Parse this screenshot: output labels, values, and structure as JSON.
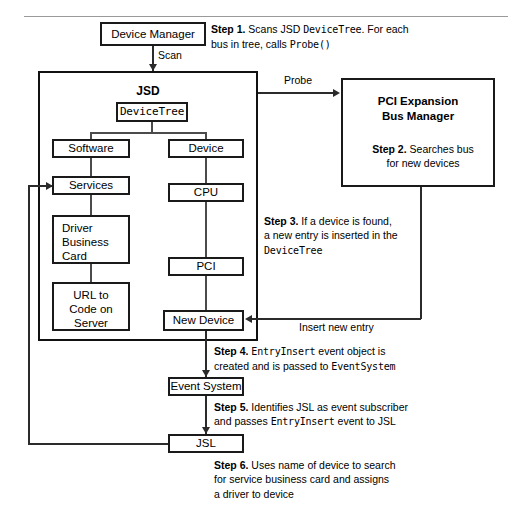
{
  "diagram": {
    "colors": {
      "box_border": "#1a1a1a",
      "container_border": "#111111",
      "line": "#4b4b4b",
      "arrow": "#2b2b2b",
      "rule": "#9a9a9a",
      "background": "#ffffff"
    }
  },
  "nodes": {
    "device_manager": "Device Manager",
    "jsd_title": "JSD",
    "device_tree": "DeviceTree",
    "software": "Software",
    "services": "Services",
    "driver_business_card": "Driver\nBusiness\nCard",
    "driver_business_card_lines": [
      "Driver",
      "Business",
      "Card"
    ],
    "url_to_code": "URL to\nCode on\nServer",
    "url_to_code_lines": [
      "URL to",
      "Code on",
      "Server"
    ],
    "device": "Device",
    "cpu": "CPU",
    "pci": "PCI",
    "new_device": "New Device",
    "event_system": "Event System",
    "jsl": "JSL",
    "pci_expansion_line1": "PCI Expansion",
    "pci_expansion_line2": "Bus Manager"
  },
  "edges": {
    "scan": "Scan",
    "probe": "Probe",
    "insert_new_entry": "Insert new entry"
  },
  "steps": {
    "step1": {
      "label": "Step 1.",
      "line1_a": "Scans JSD ",
      "line1_code": "DeviceTree",
      "line1_b": ". For each",
      "line2_a": "bus in tree, calls ",
      "line2_code": "Probe()"
    },
    "step2": {
      "label": "Step 2.",
      "line1": "Searches bus",
      "line2": "for new devices"
    },
    "step3": {
      "label": "Step 3.",
      "line1": "If a device is found,",
      "line2": "a new entry is inserted in the",
      "line3_code": "DeviceTree"
    },
    "step4": {
      "label": "Step 4.",
      "line1_code": "EntryInsert",
      "line1_a": " event object is",
      "line2_a": "created and is passed to ",
      "line2_code": "EventSystem"
    },
    "step5": {
      "label": "Step 5.",
      "line1": "Identifies JSL as event subscriber",
      "line2_a": "and passes ",
      "line2_code": "EntryInsert",
      "line2_b": " event to JSL"
    },
    "step6": {
      "label": "Step 6.",
      "line1": "Uses name of device to search",
      "line2": "for service business card and assigns",
      "line3": "a driver to device"
    }
  }
}
